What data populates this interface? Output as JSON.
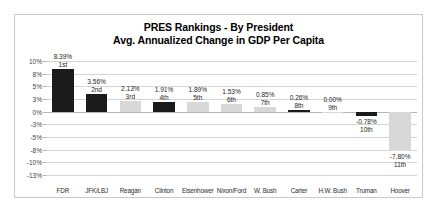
{
  "chart_data": {
    "type": "bar",
    "title": "PRES Rankings - By President",
    "subtitle": "Avg. Annualized Change in GDP Per Capita",
    "xlabel": "",
    "ylabel": "",
    "ylim": [
      -12.5,
      10
    ],
    "grid": true,
    "legend": "none",
    "ytick_labels": [
      "10%",
      "8%",
      "5%",
      "3%",
      "0%",
      "-3%",
      "-5%",
      "-8%",
      "-10%",
      "-13%"
    ],
    "ytick_values": [
      10,
      7.5,
      5,
      2.5,
      0,
      -2.5,
      -5,
      -7.5,
      -10,
      -12.5
    ],
    "categories": [
      "FDR",
      "JFK/LBJ",
      "Reagan",
      "Clinton",
      "Eisenhower",
      "Nixon/Ford",
      "W. Bush",
      "Carter",
      "H.W. Bush",
      "Truman",
      "Hoover"
    ],
    "values": [
      8.39,
      3.56,
      2.13,
      1.91,
      1.89,
      1.53,
      0.85,
      0.26,
      0.0,
      -0.78,
      -7.8
    ],
    "value_labels": [
      "8.39%",
      "3.56%",
      "2.13%",
      "1.91%",
      "1.89%",
      "1.53%",
      "0.85%",
      "0.26%",
      "0.00%",
      "-0.78%",
      "-7.80%"
    ],
    "rank_labels": [
      "1st",
      "2nd",
      "3rd",
      "4th",
      "5th",
      "6th",
      "7th",
      "8th",
      "9th",
      "10th",
      "11th"
    ],
    "bar_colors": [
      "dark",
      "dark",
      "light",
      "dark",
      "light",
      "light",
      "light",
      "dark",
      "light",
      "dark",
      "light"
    ]
  },
  "colors": {
    "dark_bar": "#1a1a1a",
    "light_bar": "#d8d8d8",
    "gridline": "#d4d4d4",
    "frame_border": "#c9c9c9",
    "text": "#242424",
    "background": "#ffffff"
  }
}
